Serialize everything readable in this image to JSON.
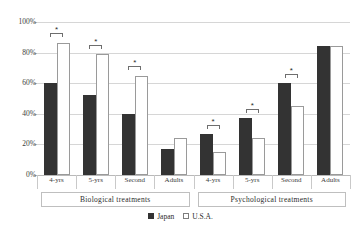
{
  "chart_data": {
    "type": "bar",
    "title": "",
    "xlabel": "",
    "ylabel": "",
    "ylim": [
      0,
      100
    ],
    "yticks": [
      "0%",
      "20%",
      "40%",
      "60%",
      "80%",
      "100%"
    ],
    "ytick_values": [
      0,
      20,
      40,
      60,
      80,
      100
    ],
    "grid": true,
    "legend_position": "bottom",
    "categories": [
      "4-yrs",
      "5-yrs",
      "Second",
      "Adults",
      "4-yrs",
      "5-yrs",
      "Second",
      "Adults"
    ],
    "groups": [
      {
        "label": "Biological  treatments",
        "categories": [
          "4-yrs",
          "5-yrs",
          "Second",
          "Adults"
        ]
      },
      {
        "label": "Psychological  treatments",
        "categories": [
          "4-yrs",
          "5-yrs",
          "Second",
          "Adults"
        ]
      }
    ],
    "series": [
      {
        "name": "Japan",
        "color": "#333333",
        "values": [
          60,
          52,
          40,
          17,
          27,
          37,
          60,
          84
        ]
      },
      {
        "name": "U.S.A.",
        "color": "#ffffff",
        "values": [
          86,
          79,
          65,
          24,
          15,
          24,
          45,
          84
        ]
      }
    ],
    "annotations": [
      {
        "category_index": 0,
        "group": "Biological  treatments",
        "label": "*",
        "top_value": 93
      },
      {
        "category_index": 1,
        "group": "Biological  treatments",
        "label": "*",
        "top_value": 85
      },
      {
        "category_index": 2,
        "group": "Biological  treatments",
        "label": "*",
        "top_value": 71
      },
      {
        "category_index": 4,
        "group": "Psychological  treatments",
        "label": "*",
        "top_value": 33
      },
      {
        "category_index": 5,
        "group": "Psychological  treatments",
        "label": "*",
        "top_value": 43
      },
      {
        "category_index": 6,
        "group": "Psychological  treatments",
        "label": "*",
        "top_value": 66
      }
    ]
  },
  "legend": {
    "items": [
      {
        "label": "Japan"
      },
      {
        "label": "U.S.A."
      }
    ]
  }
}
